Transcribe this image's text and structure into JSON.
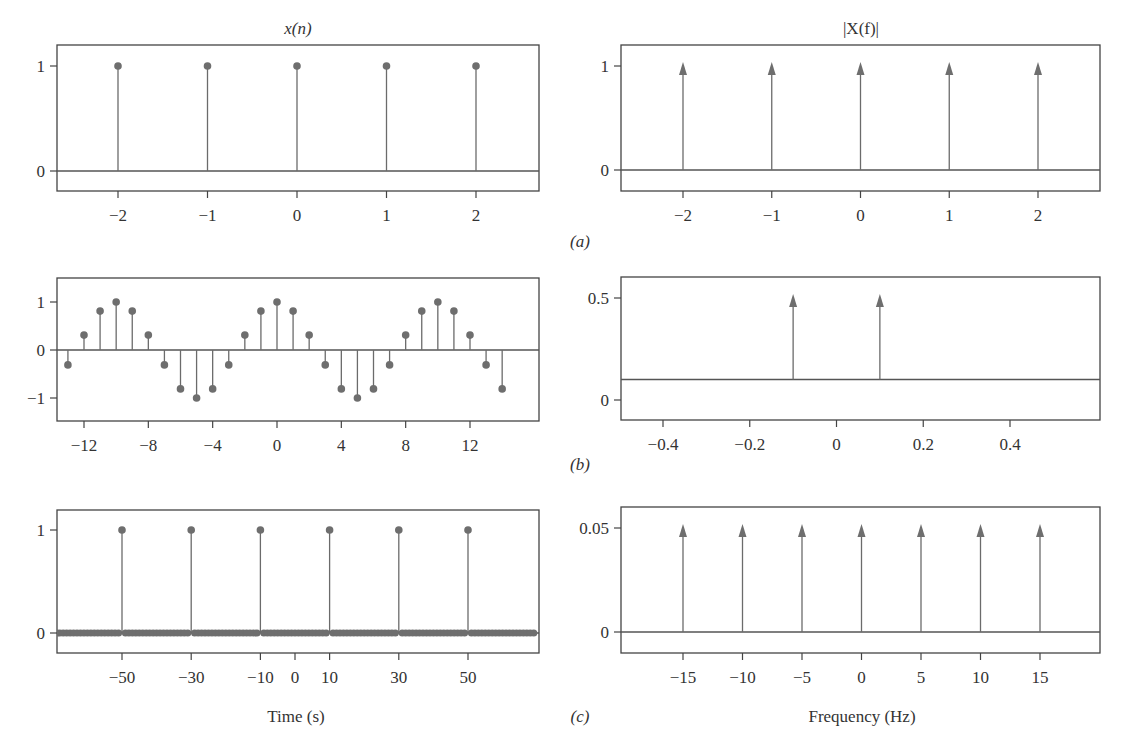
{
  "figure": {
    "captions": [
      "(a)",
      "(b)",
      "(c)"
    ],
    "left_title": "x(n)",
    "right_title": "|X(f)|",
    "left_xlabel": "Time (s)",
    "right_xlabel": "Frequency (Hz)",
    "colors": {
      "stem": "#6b6b6b",
      "marker": "#6e6e6e",
      "frame": "#444444",
      "baseline": "#555555"
    }
  },
  "chart_data": [
    {
      "id": "a-left",
      "type": "stem",
      "title": "x(n)",
      "caption": "(a)",
      "xlabel": "",
      "ylabel": "",
      "xlim": [
        -2.7,
        2.7
      ],
      "ylim": [
        -0.2,
        1.2
      ],
      "xticks": [
        -2,
        -1,
        0,
        1,
        2
      ],
      "xtick_labels": [
        "−2",
        "−1",
        "0",
        "1",
        "2"
      ],
      "yticks": [
        0,
        1
      ],
      "ytick_labels": [
        "0",
        "1"
      ],
      "x": [
        -2,
        -1,
        0,
        1,
        2
      ],
      "y": [
        1,
        1,
        1,
        1,
        1
      ],
      "marker": "dot",
      "baseline": 0
    },
    {
      "id": "a-right",
      "type": "impulse",
      "title": "|X(f)|",
      "caption": "(a)",
      "xlabel": "",
      "ylabel": "",
      "xlim": [
        -2.7,
        2.7
      ],
      "ylim": [
        -0.2,
        1.2
      ],
      "xticks": [
        -2,
        -1,
        0,
        1,
        2
      ],
      "xtick_labels": [
        "−2",
        "−1",
        "0",
        "1",
        "2"
      ],
      "yticks": [
        0,
        1
      ],
      "ytick_labels": [
        "0",
        "1"
      ],
      "x": [
        -2,
        -1,
        0,
        1,
        2
      ],
      "y": [
        1,
        1,
        1,
        1,
        1
      ],
      "marker": "arrow",
      "baseline": 0
    },
    {
      "id": "b-left",
      "type": "stem",
      "title": "",
      "caption": "(b)",
      "xlabel": "",
      "ylabel": "",
      "xlim": [
        -14,
        14
      ],
      "ylim": [
        -1.5,
        1.5
      ],
      "xticks": [
        -12,
        -8,
        -4,
        0,
        4,
        8,
        12
      ],
      "xtick_labels": [
        "−12",
        "−8",
        "−4",
        "0",
        "4",
        "8",
        "12"
      ],
      "yticks": [
        -1,
        0,
        1
      ],
      "ytick_labels": [
        "−1",
        "0",
        "1"
      ],
      "x": [
        -14,
        -13,
        -12,
        -11,
        -10,
        -9,
        -8,
        -7,
        -6,
        -5,
        -4,
        -3,
        -2,
        -1,
        0,
        1,
        2,
        3,
        4,
        5,
        6,
        7,
        8,
        9,
        10,
        11,
        12,
        13,
        14
      ],
      "y": [
        -0.81,
        -0.31,
        0.31,
        0.81,
        1,
        0.81,
        0.31,
        -0.31,
        -0.81,
        -1,
        -0.81,
        -0.31,
        0.31,
        0.81,
        1,
        0.81,
        0.31,
        -0.31,
        -0.81,
        -1,
        -0.81,
        -0.31,
        0.31,
        0.81,
        1,
        0.81,
        0.31,
        -0.31,
        -0.81
      ],
      "marker": "dot",
      "baseline": 0
    },
    {
      "id": "b-right",
      "type": "impulse",
      "title": "",
      "caption": "(b)",
      "xlabel": "",
      "ylabel": "",
      "xlim": [
        -0.5,
        0.5
      ],
      "ylim": [
        -0.06,
        0.6
      ],
      "xticks": [
        -0.4,
        -0.2,
        0,
        0.2,
        0.4
      ],
      "xtick_labels": [
        "−0.4",
        "−0.2",
        "0",
        "0.2",
        "0.4"
      ],
      "yticks": [
        0,
        0.5
      ],
      "ytick_labels": [
        "0",
        "0.5"
      ],
      "x": [
        -0.1,
        0.1
      ],
      "y": [
        0.5,
        0.5
      ],
      "marker": "arrow",
      "baseline": 0.1
    },
    {
      "id": "c-left",
      "type": "stem",
      "title": "",
      "caption": "(c)",
      "xlabel": "Time (s)",
      "ylabel": "",
      "xlim": [
        -70,
        70
      ],
      "ylim": [
        -0.2,
        1.2
      ],
      "xticks": [
        -50,
        -30,
        -10,
        0,
        10,
        30,
        50
      ],
      "xtick_labels": [
        "−50",
        "−30",
        "−10",
        "0",
        "10",
        "30",
        "50"
      ],
      "yticks": [
        0,
        1
      ],
      "ytick_labels": [
        "0",
        "1"
      ],
      "x": [
        -50,
        -30,
        -10,
        10,
        30,
        50
      ],
      "y": [
        1,
        1,
        1,
        1,
        1,
        1
      ],
      "zero_samples_range": [
        -69,
        69
      ],
      "marker": "dot",
      "baseline": 0
    },
    {
      "id": "c-right",
      "type": "impulse",
      "title": "",
      "caption": "(c)",
      "xlabel": "Frequency (Hz)",
      "ylabel": "",
      "xlim": [
        -20,
        20
      ],
      "ylim": [
        -0.01,
        0.06
      ],
      "xticks": [
        -15,
        -10,
        -5,
        0,
        5,
        10,
        15
      ],
      "xtick_labels": [
        "−15",
        "−10",
        "−5",
        "0",
        "5",
        "10",
        "15"
      ],
      "yticks": [
        0,
        0.05
      ],
      "ytick_labels": [
        "0",
        "0.05"
      ],
      "x": [
        -15,
        -10,
        -5,
        0,
        5,
        10,
        15
      ],
      "y": [
        0.05,
        0.05,
        0.05,
        0.05,
        0.05,
        0.05,
        0.05
      ],
      "marker": "arrow",
      "baseline": 0
    }
  ]
}
